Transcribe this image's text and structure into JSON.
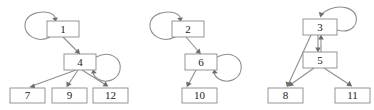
{
  "diagram": {
    "node_fill": "#ffffff",
    "node_stroke": "#8a8a8a",
    "edge_color": "#8f8f8f",
    "arrow_color": "#6d6d6d",
    "background": "#ffffff",
    "clusters": [
      {
        "name": "cluster-1",
        "nodes": [
          {
            "id": "n1",
            "label": "1",
            "x": 47,
            "y": 21,
            "w": 32,
            "h": 16
          },
          {
            "id": "n4",
            "label": "4",
            "x": 64,
            "y": 54,
            "w": 32,
            "h": 16
          },
          {
            "id": "n7",
            "label": "7",
            "x": 10,
            "y": 88,
            "w": 35,
            "h": 15
          },
          {
            "id": "n9",
            "label": "9",
            "x": 52,
            "y": 88,
            "w": 35,
            "h": 15
          },
          {
            "id": "n12",
            "label": "12",
            "x": 93,
            "y": 88,
            "w": 35,
            "h": 15
          }
        ],
        "edges": [
          {
            "from": "n1",
            "to": "n1",
            "type": "self-loop"
          },
          {
            "from": "n1",
            "to": "n4",
            "type": "arrow"
          },
          {
            "from": "n4",
            "to": "n4",
            "type": "self-loop"
          },
          {
            "from": "n4",
            "to": "n7",
            "type": "arrow"
          },
          {
            "from": "n4",
            "to": "n9",
            "type": "arrow"
          },
          {
            "from": "n4",
            "to": "n12",
            "type": "arrow"
          }
        ]
      },
      {
        "name": "cluster-2",
        "nodes": [
          {
            "id": "n2",
            "label": "2",
            "x": 172,
            "y": 21,
            "w": 32,
            "h": 16
          },
          {
            "id": "n6",
            "label": "6",
            "x": 185,
            "y": 54,
            "w": 32,
            "h": 16
          },
          {
            "id": "n10",
            "label": "10",
            "x": 182,
            "y": 88,
            "w": 35,
            "h": 15
          }
        ],
        "edges": [
          {
            "from": "n2",
            "to": "n2",
            "type": "self-loop"
          },
          {
            "from": "n2",
            "to": "n6",
            "type": "arrow"
          },
          {
            "from": "n6",
            "to": "n6",
            "type": "self-loop"
          },
          {
            "from": "n6",
            "to": "n10",
            "type": "arrow"
          }
        ]
      },
      {
        "name": "cluster-3",
        "nodes": [
          {
            "id": "n3",
            "label": "3",
            "x": 303,
            "y": 19,
            "w": 34,
            "h": 16
          },
          {
            "id": "n5",
            "label": "5",
            "x": 303,
            "y": 52,
            "w": 34,
            "h": 16
          },
          {
            "id": "n8",
            "label": "8",
            "x": 268,
            "y": 88,
            "w": 35,
            "h": 15
          },
          {
            "id": "n11",
            "label": "11",
            "x": 335,
            "y": 88,
            "w": 35,
            "h": 15
          }
        ],
        "edges": [
          {
            "from": "n3",
            "to": "n3",
            "type": "self-loop"
          },
          {
            "from": "n3",
            "to": "n5",
            "type": "arrow"
          },
          {
            "from": "n5",
            "to": "n3",
            "type": "arrow"
          },
          {
            "from": "n3",
            "to": "n8",
            "type": "arrow"
          },
          {
            "from": "n5",
            "to": "n8",
            "type": "arrow"
          },
          {
            "from": "n5",
            "to": "n11",
            "type": "arrow"
          }
        ]
      }
    ],
    "labels": {
      "n1": "1",
      "n2": "2",
      "n3": "3",
      "n4": "4",
      "n5": "5",
      "n6": "6",
      "n7": "7",
      "n8": "8",
      "n9": "9",
      "n10": "10",
      "n11": "11",
      "n12": "12"
    }
  }
}
